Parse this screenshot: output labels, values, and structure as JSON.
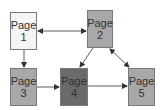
{
  "diagram": {
    "type": "page-flow",
    "nodes": [
      {
        "id": "page1",
        "word": "Page",
        "num": "1",
        "fill": "#f4f4f4",
        "x": 10,
        "y": 12,
        "w": 27,
        "h": 38
      },
      {
        "id": "page2",
        "word": "Page",
        "num": "2",
        "fill": "#a8a8a8",
        "x": 87,
        "y": 10,
        "w": 26,
        "h": 38
      },
      {
        "id": "page3",
        "word": "Page",
        "num": "3",
        "fill": "#a8a8a8",
        "x": 10,
        "y": 68,
        "w": 27,
        "h": 38
      },
      {
        "id": "page4",
        "word": "Page",
        "num": "4",
        "fill": "#6a6a6a",
        "x": 60,
        "y": 68,
        "w": 28,
        "h": 38
      },
      {
        "id": "page5",
        "word": "Page",
        "num": "5",
        "fill": "#a8a8a8",
        "x": 128,
        "y": 68,
        "w": 27,
        "h": 38
      }
    ],
    "edges": [
      {
        "from": "page1",
        "to": "page2",
        "direction": "both"
      },
      {
        "from": "page1",
        "to": "page3",
        "direction": "forward"
      },
      {
        "from": "page2",
        "to": "page4",
        "direction": "forward"
      },
      {
        "from": "page2",
        "to": "page5",
        "direction": "both"
      },
      {
        "from": "page3",
        "to": "page4",
        "direction": "forward"
      },
      {
        "from": "page4",
        "to": "page5",
        "direction": "forward"
      }
    ],
    "colors": {
      "border": "#7a7a7a",
      "edge": "#333333",
      "text": "#333333"
    }
  }
}
